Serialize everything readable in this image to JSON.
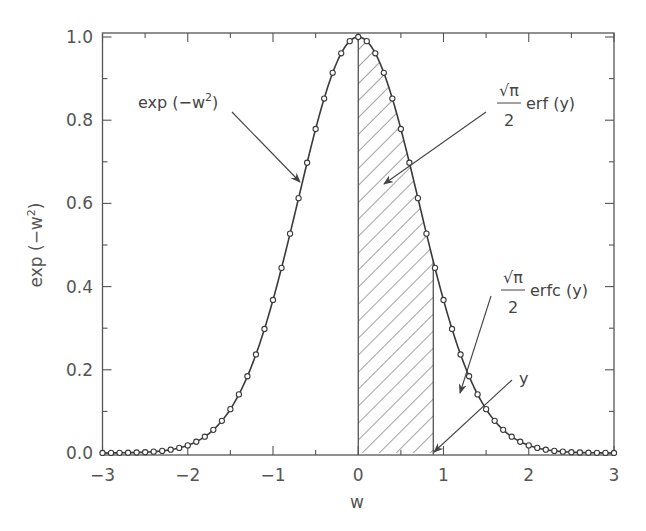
{
  "chart_data": {
    "type": "line",
    "title": "",
    "xlabel": "w",
    "ylabel": "exp (−w²)",
    "xlim": [
      -3,
      3
    ],
    "ylim": [
      0,
      1
    ],
    "xticks": [
      -3,
      -2,
      -1,
      0,
      1,
      2,
      3
    ],
    "xtick_labels": [
      "−3",
      "−2",
      "−1",
      "0",
      "1",
      "2",
      "3"
    ],
    "xminor_step": 0.5,
    "yticks": [
      0.0,
      0.2,
      0.4,
      0.6,
      0.8,
      1.0
    ],
    "ytick_labels": [
      "0.0",
      "0.2",
      "0.4",
      "0.6",
      "0.8",
      "1.0"
    ],
    "yminor_step": 0.1,
    "grid": false,
    "legend": null,
    "series": [
      {
        "name": "exp (−w²)",
        "function": "exp(-w^2)",
        "x_step": 0.1,
        "markers": "open-circle",
        "x": [
          -3.0,
          -2.9,
          -2.8,
          -2.7,
          -2.6,
          -2.5,
          -2.4,
          -2.3,
          -2.2,
          -2.1,
          -2.0,
          -1.9,
          -1.8,
          -1.7,
          -1.6,
          -1.5,
          -1.4,
          -1.3,
          -1.2,
          -1.1,
          -1.0,
          -0.9,
          -0.8,
          -0.7,
          -0.6,
          -0.5,
          -0.4,
          -0.3,
          -0.2,
          -0.1,
          0.0,
          0.1,
          0.2,
          0.3,
          0.4,
          0.5,
          0.6,
          0.7,
          0.8,
          0.9,
          1.0,
          1.1,
          1.2,
          1.3,
          1.4,
          1.5,
          1.6,
          1.7,
          1.8,
          1.9,
          2.0,
          2.1,
          2.2,
          2.3,
          2.4,
          2.5,
          2.6,
          2.7,
          2.8,
          2.9,
          3.0
        ],
        "values": [
          0.0001,
          0.0002,
          0.0004,
          0.0007,
          0.0012,
          0.0019,
          0.0032,
          0.005,
          0.0079,
          0.0122,
          0.0183,
          0.0271,
          0.0392,
          0.0556,
          0.0773,
          0.1054,
          0.1409,
          0.1845,
          0.2369,
          0.2982,
          0.3679,
          0.4449,
          0.5273,
          0.6126,
          0.6977,
          0.7788,
          0.8521,
          0.9139,
          0.9608,
          0.99,
          1.0,
          0.99,
          0.9608,
          0.9139,
          0.8521,
          0.7788,
          0.6977,
          0.6126,
          0.5273,
          0.4449,
          0.3679,
          0.2982,
          0.2369,
          0.1845,
          0.1409,
          0.1054,
          0.0773,
          0.0556,
          0.0392,
          0.0271,
          0.0183,
          0.0122,
          0.0079,
          0.005,
          0.0032,
          0.0019,
          0.0012,
          0.0007,
          0.0004,
          0.0002,
          0.0001
        ]
      }
    ],
    "shaded_region": {
      "from": 0,
      "to": 0.88,
      "pattern": "diagonal-hatch",
      "meaning": "(√π/2) erf(y)"
    },
    "annotations": [
      {
        "text": "exp (−w²)",
        "points_to": "curve left flank"
      },
      {
        "text": "(√π/2) erf (y)",
        "points_to": "hatched area"
      },
      {
        "text": "(√π/2) erfc (y)",
        "points_to": "area under right tail"
      },
      {
        "text": "y",
        "points_to": "w = y on x-axis (≈ 0.88)"
      }
    ]
  },
  "labels": {
    "xlabel": "w",
    "ylabel_main": "exp (−w",
    "ylabel_sup": "2",
    "ylabel_close": ")",
    "exp_main": "exp (−w",
    "exp_sup": "2",
    "exp_close": ")",
    "sqrt_pi": "√π",
    "two": "2",
    "erf_text": "erf (y)",
    "erfc_text": "erfc (y)",
    "y_text": "y"
  },
  "colors": {
    "curve": "#3a3a3a",
    "axis": "#555555",
    "hatch": "#555555",
    "annotation": "#555555"
  }
}
